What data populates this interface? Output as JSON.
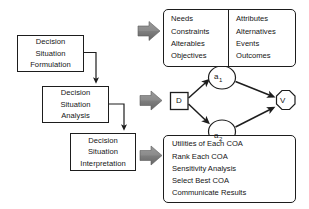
{
  "diagram": {
    "stages": [
      {
        "id": "formulation",
        "line1": "Decision",
        "line2": "Situation",
        "line3": "Formulation"
      },
      {
        "id": "analysis",
        "line1": "Decision",
        "line2": "Situation",
        "line3": "Analysis"
      },
      {
        "id": "interpretation",
        "line1": "Decision",
        "line2": "Situation",
        "line3": "Interpretation"
      }
    ],
    "formulation_outputs": {
      "left_column": [
        "Needs",
        "Constraints",
        "Alterables",
        "Objectives"
      ],
      "right_column": [
        "Attributes",
        "Alternatives",
        "Events",
        "Outcomes"
      ]
    },
    "interpretation_outputs": [
      "Utilities of Each COA",
      "Rank Each COA",
      "Sensitivity Analysis",
      "Select Best COA",
      "Communicate Results"
    ],
    "decision_tree": {
      "decision_node": "D",
      "chance_nodes": [
        {
          "base": "a",
          "subscript": "1"
        },
        {
          "base": "a",
          "subscript": "2"
        }
      ],
      "value_node": "V"
    },
    "colors": {
      "stroke": "#1d1d1d",
      "text": "#151515",
      "background": "#ffffff",
      "thick_arrow_fill": "#8a8a8a",
      "thick_arrow_shade": "#6e6e6e"
    }
  }
}
